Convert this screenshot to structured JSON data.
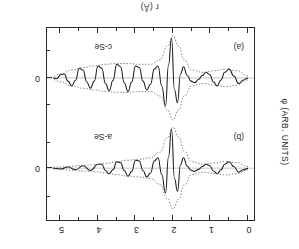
{
  "figure": {
    "x_axis": {
      "title": "r (Å)",
      "tick_labels": [
        "0",
        "1",
        "2",
        "3",
        "4",
        "5"
      ],
      "tick_values": [
        0,
        1,
        2,
        3,
        4,
        5
      ],
      "range": [
        0,
        5.2
      ],
      "minor_ticks_per_interval": 1
    },
    "y_axis": {
      "title": "φ (ARB. UNITS)",
      "tick_labels": [
        "0",
        "0"
      ],
      "note": "arbitrary units, zero marked for each panel"
    },
    "panels": [
      {
        "tag": "(a)",
        "sample": "c-Se"
      },
      {
        "tag": "(b)",
        "sample": "a-Se"
      }
    ],
    "colors": {
      "frame": "#2b2b2b",
      "solid_curve": "#1a1a1a",
      "dotted_envelope": "#6b6b6b",
      "background": "#ffffff"
    }
  },
  "chart_data": {
    "type": "line",
    "title": "",
    "xlabel": "r (Å)",
    "ylabel": "φ (ARB. UNITS)",
    "xlim": [
      0,
      5.2
    ],
    "grid": false,
    "legend": "none",
    "orientation_note": "source scan is rotated 180°",
    "panels": [
      {
        "tag": "(a)",
        "sample": "c-Se",
        "series": [
          {
            "name": "Fourier-filtered oscillation (solid)",
            "style": "solid",
            "x": [
              0.0,
              0.12,
              0.25,
              0.38,
              0.5,
              0.62,
              0.72,
              0.82,
              0.92,
              1.02,
              1.12,
              1.22,
              1.32,
              1.42,
              1.52,
              1.62,
              1.72,
              1.8,
              1.88,
              1.96,
              2.04,
              2.12,
              2.2,
              2.3,
              2.4,
              2.5,
              2.6,
              2.7,
              2.8,
              2.9,
              3.0,
              3.1,
              3.2,
              3.3,
              3.4,
              3.5,
              3.6,
              3.7,
              3.8,
              3.9,
              4.0,
              4.1,
              4.2,
              4.3,
              4.4,
              4.5,
              4.6,
              4.7,
              4.8,
              4.9,
              5.0,
              5.1,
              5.2
            ],
            "y": [
              0.0,
              0.05,
              0.14,
              -0.05,
              -0.22,
              -0.14,
              0.05,
              0.2,
              0.1,
              -0.08,
              -0.14,
              -0.06,
              0.04,
              0.12,
              0.08,
              -0.06,
              -0.28,
              -0.1,
              0.62,
              0.3,
              -1.0,
              -0.32,
              0.7,
              0.2,
              -0.3,
              -0.22,
              0.16,
              0.3,
              0.08,
              -0.26,
              -0.3,
              0.1,
              0.34,
              0.12,
              -0.28,
              -0.34,
              0.06,
              0.32,
              0.14,
              -0.24,
              -0.3,
              0.08,
              0.26,
              0.1,
              -0.2,
              -0.24,
              0.06,
              0.2,
              0.08,
              -0.1,
              -0.08,
              0.02,
              0.0
            ]
          },
          {
            "name": "Envelope upper (dotted)",
            "style": "dotted",
            "x": [
              0.0,
              0.3,
              0.6,
              0.9,
              1.2,
              1.5,
              1.7,
              1.85,
              2.0,
              2.15,
              2.35,
              2.6,
              2.9,
              3.2,
              3.5,
              3.8,
              4.1,
              4.4,
              4.7,
              5.0,
              5.2
            ],
            "y": [
              0.05,
              0.18,
              0.22,
              0.18,
              0.14,
              0.2,
              0.45,
              0.8,
              1.05,
              0.8,
              0.45,
              0.34,
              0.34,
              0.36,
              0.36,
              0.34,
              0.3,
              0.26,
              0.2,
              0.1,
              0.04
            ]
          },
          {
            "name": "Envelope lower (dotted)",
            "style": "dotted",
            "x": [
              0.0,
              0.3,
              0.6,
              0.9,
              1.2,
              1.5,
              1.7,
              1.85,
              2.0,
              2.15,
              2.35,
              2.6,
              2.9,
              3.2,
              3.5,
              3.8,
              4.1,
              4.4,
              4.7,
              5.0,
              5.2
            ],
            "y": [
              -0.05,
              -0.18,
              -0.22,
              -0.18,
              -0.14,
              -0.2,
              -0.45,
              -0.8,
              -1.05,
              -0.8,
              -0.45,
              -0.34,
              -0.34,
              -0.36,
              -0.36,
              -0.34,
              -0.3,
              -0.26,
              -0.2,
              -0.1,
              -0.04
            ]
          }
        ]
      },
      {
        "tag": "(b)",
        "sample": "a-Se",
        "series": [
          {
            "name": "Fourier-filtered oscillation (solid)",
            "style": "solid",
            "x": [
              0.0,
              0.12,
              0.25,
              0.38,
              0.5,
              0.62,
              0.72,
              0.82,
              0.92,
              1.02,
              1.12,
              1.22,
              1.32,
              1.42,
              1.52,
              1.62,
              1.72,
              1.8,
              1.88,
              1.96,
              2.04,
              2.12,
              2.2,
              2.3,
              2.4,
              2.5,
              2.6,
              2.7,
              2.8,
              2.9,
              3.0,
              3.1,
              3.2,
              3.3,
              3.4,
              3.5,
              3.6,
              3.7,
              3.8,
              3.9,
              4.0,
              4.2,
              4.4,
              4.6,
              4.8,
              5.0,
              5.2
            ],
            "y": [
              0.0,
              0.04,
              0.1,
              -0.04,
              -0.16,
              -0.1,
              0.04,
              0.14,
              0.07,
              -0.06,
              -0.1,
              -0.04,
              0.03,
              0.08,
              0.05,
              -0.05,
              -0.26,
              -0.08,
              0.58,
              0.26,
              -0.98,
              -0.28,
              0.62,
              0.16,
              -0.26,
              -0.18,
              0.12,
              0.22,
              0.06,
              -0.18,
              -0.2,
              0.08,
              0.2,
              0.06,
              -0.14,
              -0.16,
              0.04,
              0.14,
              0.06,
              -0.1,
              -0.1,
              0.06,
              -0.06,
              0.04,
              -0.03,
              0.02,
              0.0
            ]
          },
          {
            "name": "Envelope upper (dotted)",
            "style": "dotted",
            "x": [
              0.0,
              0.3,
              0.6,
              0.9,
              1.2,
              1.5,
              1.7,
              1.85,
              2.0,
              2.15,
              2.35,
              2.6,
              2.9,
              3.2,
              3.5,
              3.8,
              4.1,
              4.4,
              4.7,
              5.0,
              5.2
            ],
            "y": [
              0.04,
              0.14,
              0.17,
              0.13,
              0.1,
              0.16,
              0.42,
              0.78,
              1.02,
              0.76,
              0.4,
              0.26,
              0.22,
              0.2,
              0.16,
              0.12,
              0.09,
              0.07,
              0.05,
              0.03,
              0.02
            ]
          },
          {
            "name": "Envelope lower (dotted)",
            "style": "dotted",
            "x": [
              0.0,
              0.3,
              0.6,
              0.9,
              1.2,
              1.5,
              1.7,
              1.85,
              2.0,
              2.15,
              2.35,
              2.6,
              2.9,
              3.2,
              3.5,
              3.8,
              4.1,
              4.4,
              4.7,
              5.0,
              5.2
            ],
            "y": [
              -0.04,
              -0.14,
              -0.17,
              -0.13,
              -0.1,
              -0.16,
              -0.42,
              -0.78,
              -1.02,
              -0.76,
              -0.4,
              -0.26,
              -0.22,
              -0.2,
              -0.16,
              -0.12,
              -0.09,
              -0.07,
              -0.05,
              -0.03,
              -0.02
            ]
          }
        ]
      }
    ]
  }
}
